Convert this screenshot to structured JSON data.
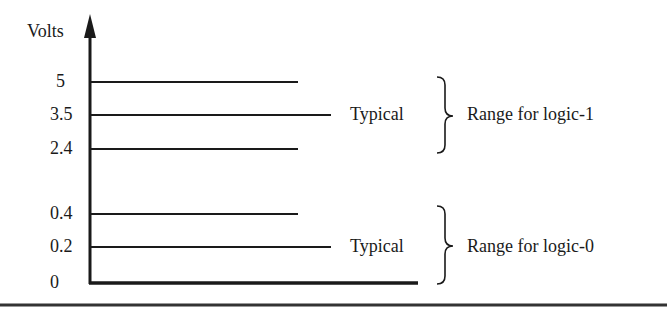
{
  "diagram": {
    "axis_label": "Volts",
    "levels": [
      {
        "label": "5",
        "y": 82,
        "x_end": 298
      },
      {
        "label": "3.5",
        "y": 115,
        "x_end": 331
      },
      {
        "label": "2.4",
        "y": 149,
        "x_end": 298
      },
      {
        "label": "0.4",
        "y": 214,
        "x_end": 298
      },
      {
        "label": "0.2",
        "y": 247,
        "x_end": 331
      },
      {
        "label": "0",
        "y": 283,
        "x_end": 418
      }
    ],
    "logic1": {
      "typical_label": "Typical",
      "range_label": "Range for logic-1"
    },
    "logic0": {
      "typical_label": "Typical",
      "range_label": "Range for logic-0"
    },
    "colors": {
      "line": "#1a1a1a",
      "background": "#ffffff"
    }
  }
}
